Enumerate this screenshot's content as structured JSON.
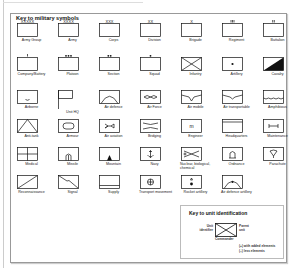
{
  "title": "Key to military symbols",
  "symbols": [
    {
      "label": "Army Group",
      "icon": "army-group-icon"
    },
    {
      "label": "Army",
      "icon": "army-icon"
    },
    {
      "label": "Corps",
      "icon": "corps-icon"
    },
    {
      "label": "Division",
      "icon": "division-icon"
    },
    {
      "label": "Brigade",
      "icon": "brigade-icon"
    },
    {
      "label": "Regiment",
      "icon": "regiment-icon"
    },
    {
      "label": "Battalion",
      "icon": "battalion-icon"
    },
    {
      "label": "Company/Battery",
      "icon": "company-icon"
    },
    {
      "label": "Platoon",
      "icon": "platoon-icon"
    },
    {
      "label": "Section",
      "icon": "section-icon"
    },
    {
      "label": "Squad",
      "icon": "squad-icon"
    },
    {
      "label": "Infantry",
      "icon": "infantry-icon"
    },
    {
      "label": "Artillery",
      "icon": "artillery-icon"
    },
    {
      "label": "Cavalry",
      "icon": "cavalry-icon"
    },
    {
      "label": "Airborne",
      "icon": "airborne-icon"
    },
    {
      "label": "Unit HQ",
      "icon": "unit-hq-icon"
    },
    {
      "label": "Air defence",
      "icon": "air-defence-icon"
    },
    {
      "label": "Air Force",
      "icon": "air-force-icon"
    },
    {
      "label": "Air mobile",
      "icon": "air-mobile-icon"
    },
    {
      "label": "Air transportable",
      "icon": "air-transportable-icon"
    },
    {
      "label": "Amphibious",
      "icon": "amphibious-icon"
    },
    {
      "label": "Anti-tank",
      "icon": "anti-tank-icon"
    },
    {
      "label": "Armour",
      "icon": "armour-icon"
    },
    {
      "label": "Air aviation",
      "icon": "air-aviation-icon"
    },
    {
      "label": "Bridging",
      "icon": "bridging-icon"
    },
    {
      "label": "Engineer",
      "icon": "engineer-icon"
    },
    {
      "label": "Headquarters",
      "icon": "headquarters-icon"
    },
    {
      "label": "Maintenance",
      "icon": "maintenance-icon"
    },
    {
      "label": "Medical",
      "icon": "medical-icon"
    },
    {
      "label": "Missile",
      "icon": "missile-icon"
    },
    {
      "label": "Mountain",
      "icon": "mountain-icon"
    },
    {
      "label": "Navy",
      "icon": "navy-icon"
    },
    {
      "label": "Nuclear, biological, chemical",
      "icon": "nbc-icon"
    },
    {
      "label": "Ordnance",
      "icon": "ordnance-icon"
    },
    {
      "label": "Parachute",
      "icon": "parachute-icon"
    },
    {
      "label": "Reconnaissance",
      "icon": "reconnaissance-icon"
    },
    {
      "label": "Signal",
      "icon": "signal-icon"
    },
    {
      "label": "Supply",
      "icon": "supply-icon"
    },
    {
      "label": "Transport movement",
      "icon": "transport-movement-icon"
    },
    {
      "label": "Rocket artillery",
      "icon": "rocket-artillery-icon"
    },
    {
      "label": "Air defence artillery",
      "icon": "air-defence-artillery-icon"
    }
  ],
  "unit_key": {
    "title": "Key to unit identification",
    "unit_identifier": "Unit identifier",
    "parent_unit": "Parent unit",
    "commander": "Commander",
    "added": "(+) with added elements",
    "less": "(–) less elements"
  }
}
